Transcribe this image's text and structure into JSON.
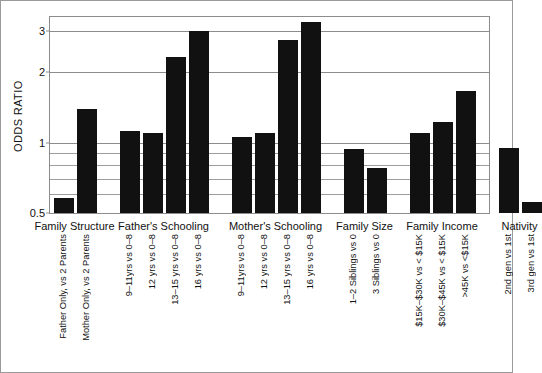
{
  "chart_data": {
    "type": "bar",
    "title": "",
    "xlabel": "",
    "ylabel": "ODDS RATIO",
    "yscale": "log",
    "ylim": [
      0.5,
      3.45
    ],
    "grid": true,
    "legend": "none",
    "ytick_labels": [
      "0.5",
      "1",
      "2",
      "3"
    ],
    "ytick_values": [
      0.5,
      1,
      2,
      3
    ],
    "minor_gridlines": [
      0.6,
      0.7,
      0.8,
      0.9
    ],
    "baseline": 0.5,
    "groups": [
      {
        "name": "Family Structure",
        "categories": [
          "Father Only, vs 2 Parents",
          "Mother Only, vs 2 Parents"
        ],
        "values": [
          0.58,
          1.39
        ]
      },
      {
        "name": "Father's Schooling",
        "categories": [
          "9–11yrs vs 0–8",
          "12 yrs vs 0–8",
          "13–15 yrs vs 0–8",
          "16 yrs vs 0–8"
        ],
        "values": [
          1.12,
          1.1,
          2.33,
          3.01
        ]
      },
      {
        "name": "Mother's Schooling",
        "categories": [
          "9–11yrs vs 0–8",
          "12 yrs vs 0–8",
          "13–15 yrs vs 0–8",
          "16 yrs vs 0–8"
        ],
        "values": [
          1.06,
          1.1,
          2.76,
          3.29
        ]
      },
      {
        "name": "Family Size",
        "categories": [
          "1–2 Siblings vs 0",
          "3 Siblings vs 0"
        ],
        "values": [
          0.94,
          0.78
        ]
      },
      {
        "name": "Family Income",
        "categories": [
          "$15K–$30K vs < $15K",
          "$30K–$45K vs < $15K",
          ">45K vs <$15K"
        ],
        "values": [
          1.1,
          1.23,
          1.67
        ]
      },
      {
        "name": "Nativity",
        "categories": [
          "2nd gen vs 1st",
          "3rd gen vs 1st"
        ],
        "values": [
          0.95,
          0.56
        ]
      }
    ],
    "bar_color": "#111111",
    "background_color": "#ffffff",
    "axis_color": "#8c8c8c"
  }
}
